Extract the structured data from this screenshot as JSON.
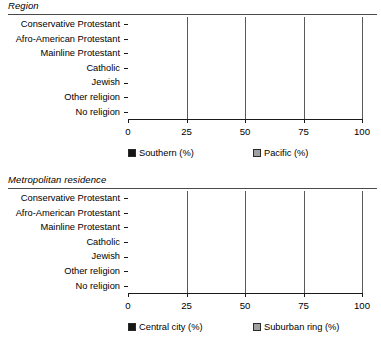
{
  "figure": {
    "panels": [
      {
        "id": "region",
        "title": "Region",
        "axis": {
          "min": 0,
          "max": 100,
          "ticks": [
            "0",
            "25",
            "50",
            "75",
            "100"
          ]
        },
        "legend": [
          {
            "label": "Southern (%)",
            "color": "#161616",
            "key": "southern"
          },
          {
            "label": "Pacific (%)",
            "color": "#a0a0a0",
            "key": "pacific"
          }
        ]
      },
      {
        "id": "metro",
        "title": "Metropolitan residence",
        "axis": {
          "min": 0,
          "max": 100,
          "ticks": [
            "0",
            "25",
            "50",
            "75",
            "100"
          ]
        },
        "legend": [
          {
            "label": "Central city (%)",
            "color": "#161616",
            "key": "central_city"
          },
          {
            "label": "Suburban ring (%)",
            "color": "#a0a0a0",
            "key": "suburban_ring"
          }
        ]
      }
    ]
  },
  "chart_data": [
    {
      "type": "bar",
      "orientation": "horizontal",
      "stacked": true,
      "title": "Region",
      "xlabel": "",
      "ylabel": "",
      "xlim": [
        0,
        100
      ],
      "grid": true,
      "legend_position": "bottom",
      "categories": [
        "Conservative Protestant",
        "Afro-American Protestant",
        "Mainline Protestant",
        "Catholic",
        "Jewish",
        "Other religion",
        "No religion"
      ],
      "series": [
        {
          "name": "Southern (%)",
          "color": "#161616",
          "values": [
            52,
            59,
            34,
            21,
            26,
            20,
            27
          ]
        },
        {
          "name": "Pacific (%)",
          "color": "#8e8e8e",
          "values": [
            11,
            5,
            14,
            16,
            18,
            18,
            21
          ]
        }
      ],
      "totals": [
        63,
        64,
        48,
        37,
        44,
        38,
        48
      ],
      "tick_labels": [
        "0",
        "25",
        "50",
        "75",
        "100"
      ]
    },
    {
      "type": "bar",
      "orientation": "horizontal",
      "stacked": true,
      "title": "Metropolitan residence",
      "xlabel": "",
      "ylabel": "",
      "xlim": [
        0,
        100
      ],
      "grid": true,
      "legend_position": "bottom",
      "categories": [
        "Conservative Protestant",
        "Afro-American Protestant",
        "Mainline Protestant",
        "Catholic",
        "Jewish",
        "Other religion",
        "No religion"
      ],
      "series": [
        {
          "name": "Central city (%)",
          "color": "#161616",
          "values": [
            21,
            45,
            15,
            22,
            45,
            34,
            29
          ]
        },
        {
          "name": "Suburban ring (%)",
          "color": "#8e8e8e",
          "values": [
            18,
            23,
            22,
            32,
            45,
            32,
            29
          ]
        }
      ],
      "totals": [
        39,
        68,
        37,
        54,
        90,
        66,
        58
      ],
      "tick_labels": [
        "0",
        "25",
        "50",
        "75",
        "100"
      ]
    }
  ]
}
